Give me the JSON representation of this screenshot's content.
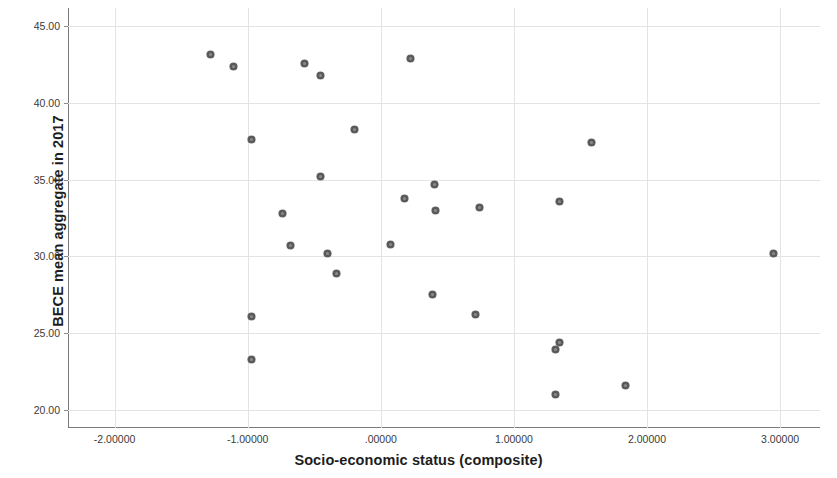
{
  "chart_data": {
    "type": "scatter",
    "title": "",
    "xlabel": "Socio-economic status (composite)",
    "ylabel": "BECE mean aggregate in 2017",
    "xlim": [
      -2.35,
      3.3
    ],
    "ylim": [
      18.8,
      46.2
    ],
    "xticks": [
      -2,
      -1,
      0,
      1,
      2,
      3
    ],
    "xtick_labels": [
      "-2.00000",
      "-1.00000",
      ".00000",
      "1.00000",
      "2.00000",
      "3.00000"
    ],
    "yticks": [
      20,
      25,
      30,
      35,
      40,
      45
    ],
    "ytick_labels": [
      "20.00",
      "25.00",
      "30.00",
      "35.00",
      "40.00",
      "45.00"
    ],
    "grid": true,
    "legend": "none",
    "marker": {
      "shape": "circle",
      "color": "#595959",
      "size_px": 7
    },
    "points": [
      {
        "x": -1.28,
        "y": 43.2
      },
      {
        "x": -1.11,
        "y": 42.4
      },
      {
        "x": -0.97,
        "y": 37.6
      },
      {
        "x": -0.97,
        "y": 26.1
      },
      {
        "x": -0.97,
        "y": 23.3
      },
      {
        "x": -0.74,
        "y": 32.8
      },
      {
        "x": -0.68,
        "y": 30.7
      },
      {
        "x": -0.57,
        "y": 42.6
      },
      {
        "x": -0.45,
        "y": 41.8
      },
      {
        "x": -0.45,
        "y": 35.2
      },
      {
        "x": -0.4,
        "y": 30.2
      },
      {
        "x": -0.33,
        "y": 28.9
      },
      {
        "x": -0.2,
        "y": 38.3
      },
      {
        "x": 0.07,
        "y": 30.8
      },
      {
        "x": 0.18,
        "y": 33.8
      },
      {
        "x": 0.22,
        "y": 42.9
      },
      {
        "x": 0.4,
        "y": 34.7
      },
      {
        "x": 0.41,
        "y": 33.0
      },
      {
        "x": 0.39,
        "y": 27.5
      },
      {
        "x": 0.74,
        "y": 33.2
      },
      {
        "x": 0.71,
        "y": 26.2
      },
      {
        "x": 1.34,
        "y": 33.6
      },
      {
        "x": 1.34,
        "y": 24.4
      },
      {
        "x": 1.31,
        "y": 23.9
      },
      {
        "x": 1.31,
        "y": 21.0
      },
      {
        "x": 1.58,
        "y": 37.4
      },
      {
        "x": 1.84,
        "y": 21.6
      },
      {
        "x": 2.95,
        "y": 30.2
      }
    ]
  }
}
